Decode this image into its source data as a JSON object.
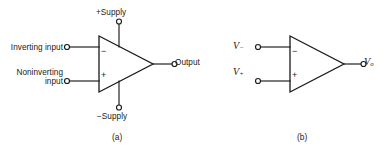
{
  "figure": {
    "background_color": "#ffffff",
    "ink_color": "#1a1a1a",
    "subfigures": [
      {
        "caption": "(a)",
        "title_role": "operational-amplifier-symbol-with-supply-pins",
        "labels": {
          "inverting_input": "Inverting input",
          "noninverting_input": "Noninverting input",
          "positive_supply": "+Supply",
          "negative_supply": "−Supply",
          "output": "Output",
          "inverting_pin_sign": "−",
          "noninverting_pin_sign": "+"
        }
      },
      {
        "caption": "(b)",
        "title_role": "simplified-operational-amplifier-symbol",
        "labels": {
          "inverting_input_symbol": "V",
          "inverting_input_subscript": "−",
          "noninverting_input_symbol": "V",
          "noninverting_input_subscript": "+",
          "output_symbol": "V",
          "output_subscript": "o",
          "inverting_pin_sign": "−",
          "noninverting_pin_sign": "+"
        }
      }
    ]
  }
}
